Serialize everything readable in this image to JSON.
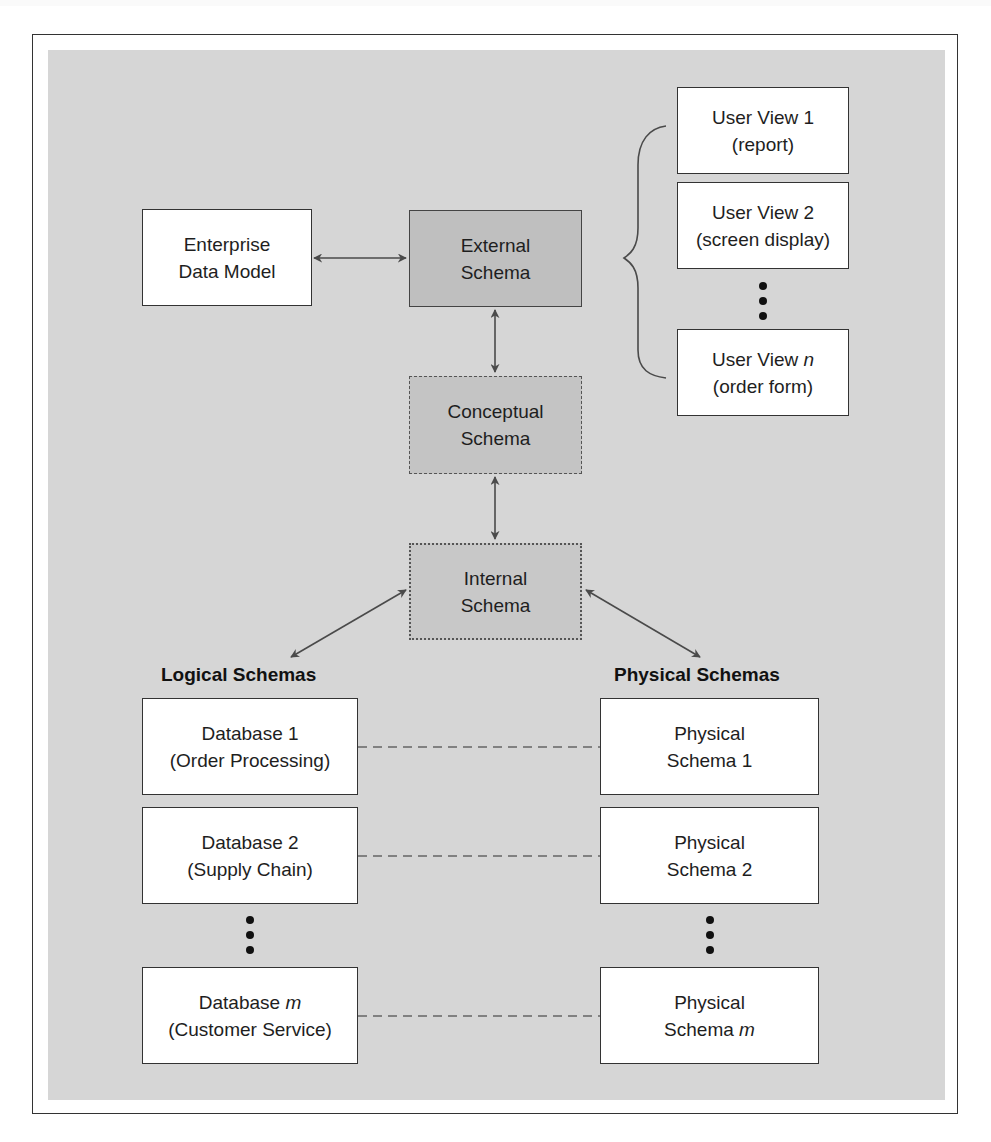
{
  "diagram": {
    "colors": {
      "panel_background": "#d6d6d6",
      "external_fill": "#bfbfbf",
      "conceptual_fill": "#c4c4c4",
      "internal_fill": "#c8c8c8",
      "plain_box_fill": "#ffffff",
      "line_color": "#444444"
    },
    "enterprise": {
      "line1": "Enterprise",
      "line2": "Data Model"
    },
    "external": {
      "line1": "External",
      "line2": "Schema"
    },
    "conceptual": {
      "line1": "Conceptual",
      "line2": "Schema"
    },
    "internal": {
      "line1": "Internal",
      "line2": "Schema"
    },
    "user_views": [
      {
        "line1": "User View 1",
        "line2": "(report)"
      },
      {
        "line1": "User View 2",
        "line2": "(screen display)"
      },
      {
        "line1_prefix": "User View ",
        "line1_italic": "n",
        "line2": "(order form)"
      }
    ],
    "logical_heading": "Logical Schemas",
    "physical_heading": "Physical Schemas",
    "databases": [
      {
        "line1": "Database 1",
        "line2": "(Order Processing)"
      },
      {
        "line1": "Database 2",
        "line2": "(Supply Chain)"
      },
      {
        "line1_prefix": "Database ",
        "line1_italic": "m",
        "line2": "(Customer Service)"
      }
    ],
    "physical_schemas": [
      {
        "line1": "Physical",
        "line2": "Schema 1"
      },
      {
        "line1": "Physical",
        "line2": "Schema 2"
      },
      {
        "line1": "Physical",
        "line2_prefix": "Schema ",
        "line2_italic": "m"
      }
    ],
    "connections": [
      {
        "from": "Enterprise Data Model",
        "to": "External Schema",
        "type": "bidirectional-arrow"
      },
      {
        "from": "External Schema",
        "to": "Conceptual Schema",
        "type": "bidirectional-arrow"
      },
      {
        "from": "Conceptual Schema",
        "to": "Internal Schema",
        "type": "bidirectional-arrow"
      },
      {
        "from": "Internal Schema",
        "to": "Logical Schemas",
        "type": "bidirectional-arrow"
      },
      {
        "from": "Internal Schema",
        "to": "Physical Schemas",
        "type": "bidirectional-arrow"
      },
      {
        "from": "External Schema",
        "to": "User Views",
        "type": "brace"
      },
      {
        "from": "Database 1",
        "to": "Physical Schema 1",
        "type": "dashed-line"
      },
      {
        "from": "Database 2",
        "to": "Physical Schema 2",
        "type": "dashed-line"
      },
      {
        "from": "Database m",
        "to": "Physical Schema m",
        "type": "dashed-line"
      }
    ]
  }
}
